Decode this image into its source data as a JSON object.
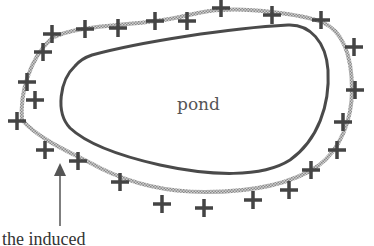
{
  "diagram": {
    "pond_label": "pond",
    "caption": "the induced",
    "colors": {
      "pond_outline": "#4a4a4a",
      "charge_ring": "#a8a8a8",
      "plus_sign": "#444444",
      "arrow": "#555555",
      "background": "#ffffff"
    },
    "charge_symbol": "+",
    "charge_positions": [
      [
        52,
        34
      ],
      [
        85,
        29
      ],
      [
        118,
        28
      ],
      [
        155,
        21
      ],
      [
        187,
        21
      ],
      [
        221,
        8
      ],
      [
        272,
        15
      ],
      [
        321,
        20
      ],
      [
        354,
        47
      ],
      [
        355,
        90
      ],
      [
        343,
        122
      ],
      [
        337,
        150
      ],
      [
        311,
        170
      ],
      [
        289,
        190
      ],
      [
        253,
        200
      ],
      [
        204,
        208
      ],
      [
        162,
        204
      ],
      [
        120,
        182
      ],
      [
        78,
        161
      ],
      [
        45,
        150
      ],
      [
        17,
        121
      ],
      [
        35,
        100
      ],
      [
        27,
        82
      ],
      [
        43,
        52
      ]
    ]
  }
}
